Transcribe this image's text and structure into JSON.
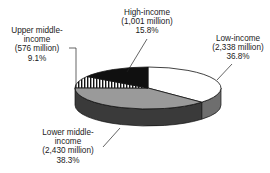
{
  "chart_data": {
    "type": "pie",
    "style": "3d-exploded-none",
    "title": "",
    "unit": "million",
    "start": "top",
    "direction": "clockwise",
    "slices": [
      {
        "name": "Low-income",
        "value": 2338,
        "percent": 36.8,
        "label_lines": [
          "Low-income",
          "(2,338 million)",
          "36.8%"
        ],
        "fill": "#ffffff",
        "side": "#6e6e6e",
        "pattern": "solid",
        "label_side": "top-right"
      },
      {
        "name": "Lower middle-income",
        "value": 2430,
        "percent": 38.3,
        "label_lines": [
          "Lower middle-",
          "income",
          "(2,430 million)",
          "38.3%"
        ],
        "fill": "#9a9a9a",
        "side": "#3a3a3a",
        "pattern": "solid",
        "label_side": "bottom-left"
      },
      {
        "name": "Upper middle-income",
        "value": 576,
        "percent": 9.1,
        "label_lines": [
          "Upper middle-",
          "income",
          "(576 million)",
          "9.1%"
        ],
        "fill": "#ffffff",
        "side": "#303030",
        "pattern": "vertical-stripes",
        "label_side": "top-left"
      },
      {
        "name": "High-income",
        "value": 1001,
        "percent": 15.8,
        "label_lines": [
          "High-income",
          "(1,001 million)",
          "15.8%"
        ],
        "fill": "#101010",
        "side": "#050505",
        "pattern": "solid",
        "label_side": "top"
      }
    ]
  }
}
